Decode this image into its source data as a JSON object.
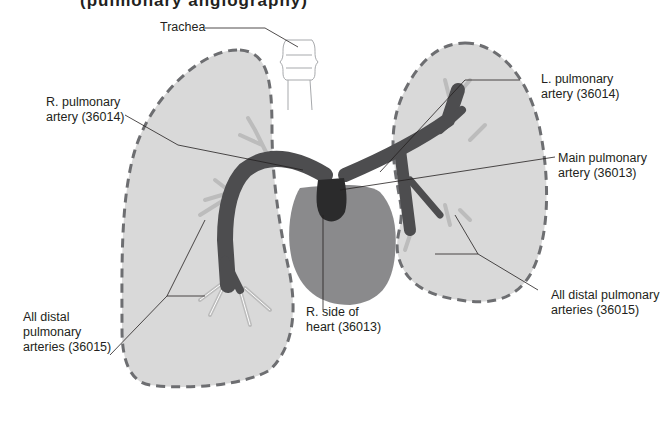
{
  "figure": {
    "cropped_title_fragment": "(pulmonary angiography)",
    "colors": {
      "lung_fill": "#d9d9d9",
      "lung_outline": "#6d6e71",
      "artery_dark": "#4d4d4f",
      "artery_darkest": "#2b2b2c",
      "heart_fill": "#8a8a8c",
      "distal_vessels": "#bcbcbc",
      "leader_line": "#231f20",
      "trachea": "#a7a9ac"
    },
    "labels": {
      "trachea": {
        "lines": [
          "Trachea"
        ]
      },
      "r_pulmonary_artery": {
        "lines": [
          "R. pulmonary",
          "artery (36014)"
        ]
      },
      "l_pulmonary_artery": {
        "lines": [
          "L. pulmonary",
          "artery (36014)"
        ]
      },
      "main_pulmonary_artery": {
        "lines": [
          "Main pulmonary",
          "artery (36013)"
        ]
      },
      "r_side_of_heart": {
        "lines": [
          "R. side of",
          "heart (36013)"
        ]
      },
      "distal_left": {
        "lines": [
          "All distal",
          "pulmonary",
          "arteries (36015)"
        ]
      },
      "distal_right": {
        "lines": [
          "All distal pulmonary",
          "arteries (36015)"
        ]
      }
    }
  }
}
